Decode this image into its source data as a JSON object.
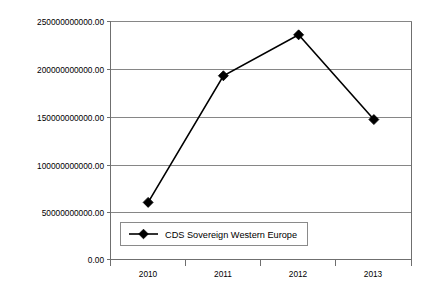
{
  "chart_data": {
    "type": "line",
    "title": "",
    "xlabel": "",
    "ylabel": "",
    "categories": [
      "2010",
      "2011",
      "2012",
      "2013"
    ],
    "series": [
      {
        "name": "CDS Sovereign Western Europe",
        "values": [
          60000000000,
          193000000000,
          236000000000,
          147000000000
        ],
        "marker": "diamond",
        "color": "#000000"
      }
    ],
    "ylim": [
      0,
      250000000000
    ],
    "ytick_values": [
      0,
      50000000000,
      100000000000,
      150000000000,
      200000000000,
      250000000000
    ],
    "ytick_labels": [
      "0.00",
      "50000000000.00",
      "100000000000.00",
      "150000000000.00",
      "200000000000.00",
      "250000000000.00"
    ],
    "xtick_labels": [
      "2010",
      "2011",
      "2012",
      "2013"
    ],
    "grid": "horizontal",
    "legend_position": "inside-bottom-left",
    "background": "#ffffff",
    "gridline_color": "#868686",
    "axis_color": "#6f6f6f"
  },
  "legend": {
    "entries": [
      {
        "label": "CDS Sovereign Western Europe",
        "marker": "diamond",
        "color": "#000000"
      }
    ]
  },
  "axis": {
    "y_labels": [
      {
        "text": "250000000000.00",
        "value": 250000000000
      },
      {
        "text": "200000000000.00",
        "value": 200000000000
      },
      {
        "text": "150000000000.00",
        "value": 150000000000
      },
      {
        "text": "100000000000.00",
        "value": 100000000000
      },
      {
        "text": "50000000000.00",
        "value": 50000000000
      },
      {
        "text": "0.00",
        "value": 0
      }
    ],
    "x_labels": [
      {
        "text": "2010"
      },
      {
        "text": "2011"
      },
      {
        "text": "2012"
      },
      {
        "text": "2013"
      }
    ]
  }
}
